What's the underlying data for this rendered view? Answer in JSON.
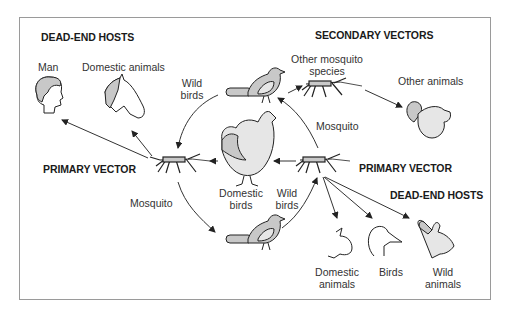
{
  "diagram": {
    "headings": {
      "dead_end_hosts_top": "DEAD-END HOSTS",
      "secondary_vectors": "SECONDARY VECTORS",
      "primary_vector_left": "PRIMARY VECTOR",
      "primary_vector_right": "PRIMARY VECTOR",
      "dead_end_hosts_bottom": "DEAD-END HOSTS"
    },
    "labels": {
      "man": "Man",
      "domestic_animals_top": "Domestic animals",
      "wild_birds_top_1": "Wild",
      "wild_birds_top_2": "birds",
      "other_mosquito_1": "Other mosquito",
      "other_mosquito_2": "species",
      "other_animals": "Other animals",
      "mosquito_right": "Mosquito",
      "mosquito_left": "Mosquito",
      "domestic_birds_1": "Domestic",
      "domestic_birds_2": "birds",
      "wild_birds_bottom_1": "Wild",
      "wild_birds_bottom_2": "birds",
      "domestic_animals_bottom_1": "Domestic",
      "domestic_animals_bottom_2": "animals",
      "birds": "Birds",
      "wild_animals_1": "Wild",
      "wild_animals_2": "animals"
    },
    "icons": [
      "human-head-icon",
      "horse-head-icon",
      "wild-bird-icon",
      "mosquito-icon",
      "squirrel-icon",
      "chicken-icon",
      "pig-head-icon",
      "duck-head-icon",
      "rabbit-head-icon"
    ],
    "colors": {
      "stroke": "#222222",
      "fill_gray": "#c8c8c8",
      "fill_light": "#e6e6e6",
      "frame": "#9a9a9a"
    }
  }
}
